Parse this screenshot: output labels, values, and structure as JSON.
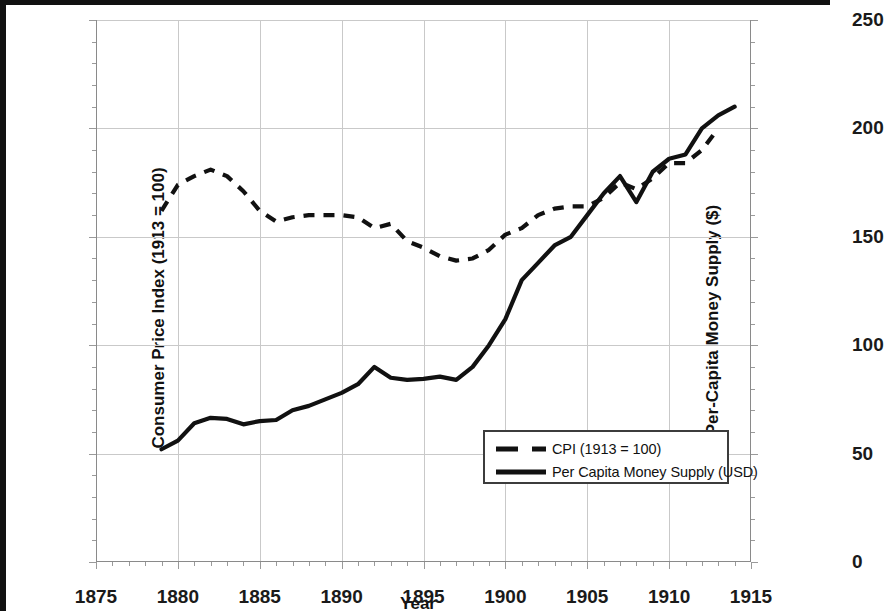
{
  "chart_data": {
    "type": "line",
    "title": "",
    "xlabel": "Year",
    "ylabel": "Consumer Price Index (1913 = 100)",
    "ylabel_right": "Per-Capita Money Supply ($)",
    "xlim": [
      1875,
      1915
    ],
    "ylim": [
      0,
      125
    ],
    "ylim_right": [
      0,
      250
    ],
    "xticks": [
      1875,
      1880,
      1885,
      1890,
      1895,
      1900,
      1905,
      1910,
      1915
    ],
    "yticks": [
      0,
      25,
      50,
      75,
      100,
      125
    ],
    "yticks_right": [
      0,
      50,
      100,
      150,
      200,
      250
    ],
    "xtick_minor_step": 1,
    "ytick_minor_step": 5,
    "grid": true,
    "legend_position": "lower right",
    "series": [
      {
        "name": "CPI (1913 = 100)",
        "axis": "left",
        "style": "dashed",
        "color": "#111111",
        "x": [
          1879,
          1880,
          1881,
          1882,
          1883,
          1884,
          1885,
          1886,
          1887,
          1888,
          1889,
          1890,
          1891,
          1892,
          1893,
          1894,
          1895,
          1896,
          1897,
          1898,
          1899,
          1900,
          1901,
          1902,
          1903,
          1904,
          1905,
          1906,
          1907,
          1908,
          1909,
          1910,
          1911,
          1912,
          1913
        ],
        "y": [
          81,
          87,
          89,
          90.5,
          89,
          85.5,
          81,
          78.5,
          79.5,
          80,
          80,
          80,
          79.5,
          77,
          78,
          74,
          72.5,
          70.5,
          69.5,
          70,
          72,
          75.5,
          77,
          80,
          81.5,
          82,
          82,
          84,
          87.5,
          86,
          88.5,
          92,
          92,
          95,
          100
        ]
      },
      {
        "name": "Per Capita Money Supply (USD)",
        "axis": "right",
        "style": "solid",
        "color": "#111111",
        "x": [
          1879,
          1880,
          1881,
          1882,
          1883,
          1884,
          1885,
          1886,
          1887,
          1888,
          1889,
          1890,
          1891,
          1892,
          1893,
          1894,
          1895,
          1896,
          1897,
          1898,
          1899,
          1900,
          1901,
          1902,
          1903,
          1904,
          1905,
          1906,
          1907,
          1908,
          1909,
          1910,
          1911,
          1912,
          1913,
          1914
        ],
        "y_right": [
          52,
          56,
          64,
          66.5,
          66,
          63.5,
          65,
          65.5,
          70,
          72,
          75,
          78,
          82,
          90,
          85,
          84,
          84.5,
          85.5,
          84,
          90,
          100,
          112,
          130,
          138,
          146,
          150,
          160,
          170,
          178,
          166,
          180,
          186,
          188,
          200,
          206,
          210
        ],
        "y_left": [
          26,
          28,
          32,
          33.25,
          33,
          31.75,
          32.5,
          32.75,
          35,
          36,
          37.5,
          39,
          41,
          45,
          42.5,
          42,
          42.25,
          42.75,
          42,
          45,
          50,
          56,
          65,
          69,
          73,
          75,
          80,
          85,
          89,
          83,
          90,
          93,
          94,
          100,
          103,
          105
        ]
      }
    ]
  },
  "legend": {
    "items": [
      {
        "label": "CPI (1913 = 100)",
        "style": "dashed"
      },
      {
        "label": "Per Capita Money Supply (USD)",
        "style": "solid"
      }
    ]
  }
}
